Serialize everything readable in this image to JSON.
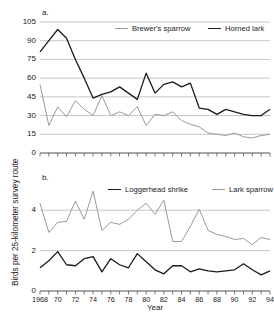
{
  "figure": {
    "xaxis_title": "Year",
    "yaxis_title": "Birds per 25-kilometer  survey route",
    "panel_a_letter": "a.",
    "panel_b_letter": "b."
  },
  "colors": {
    "dark_series": "#1a1a1a",
    "light_series": "#9a9a9a",
    "gridline": "#b9b9b9",
    "axis": "#555555",
    "background": "#ffffff"
  },
  "panel_a": {
    "legend": [
      {
        "label": "Brewer's sparrow",
        "color": "#9a9a9a"
      },
      {
        "label": "Horned lark",
        "color": "#1a1a1a"
      }
    ],
    "yticks": [
      "0",
      "15",
      "30",
      "45",
      "60",
      "75",
      "90",
      "105"
    ]
  },
  "panel_b": {
    "legend": [
      {
        "label": "Loggerhead shrike",
        "color": "#1a1a1a"
      },
      {
        "label": "Lark sparrow",
        "color": "#9a9a9a"
      }
    ],
    "yticks": [
      "0",
      "2",
      "4"
    ]
  },
  "xticks": [
    "1968",
    "70",
    "72",
    "74",
    "76",
    "78",
    "80",
    "82",
    "84",
    "86",
    "88",
    "90",
    "92",
    "94"
  ],
  "chart_data": [
    {
      "type": "line",
      "panel": "a.",
      "title": "",
      "xlabel": "Year",
      "ylabel": "Birds per 25-kilometer survey route",
      "xlim": [
        1968,
        1994
      ],
      "ylim": [
        0,
        105
      ],
      "yticks": [
        0,
        15,
        30,
        45,
        60,
        75,
        90,
        105
      ],
      "xticks": [
        1968,
        1970,
        1972,
        1974,
        1976,
        1978,
        1980,
        1982,
        1984,
        1986,
        1988,
        1990,
        1992,
        1994
      ],
      "grid": true,
      "legend_position": "top-right-inside",
      "x": [
        1968,
        1969,
        1970,
        1971,
        1972,
        1973,
        1974,
        1975,
        1976,
        1977,
        1978,
        1979,
        1980,
        1981,
        1982,
        1983,
        1984,
        1985,
        1986,
        1987,
        1988,
        1989,
        1990,
        1991,
        1992,
        1993,
        1994
      ],
      "series": [
        {
          "name": "Horned lark",
          "color": "#1a1a1a",
          "values": [
            81,
            90,
            99,
            92,
            75,
            60,
            44,
            47,
            49,
            53,
            48,
            43,
            64,
            48,
            55,
            57,
            53,
            56,
            36,
            35,
            31,
            35,
            33,
            31,
            30,
            30,
            35
          ]
        },
        {
          "name": "Brewer's sparrow",
          "color": "#9a9a9a",
          "values": [
            55,
            22,
            37,
            29,
            42,
            35,
            30,
            46,
            30,
            33,
            30,
            37,
            22,
            31,
            30,
            33,
            26,
            23,
            21,
            16,
            15,
            14,
            16,
            13,
            12,
            14,
            15
          ]
        }
      ]
    },
    {
      "type": "line",
      "panel": "b.",
      "title": "",
      "xlabel": "Year",
      "ylabel": "Birds per 25-kilometer survey route",
      "xlim": [
        1968,
        1994
      ],
      "ylim": [
        0,
        5.2
      ],
      "yticks": [
        0,
        2,
        4
      ],
      "xticks": [
        1968,
        1970,
        1972,
        1974,
        1976,
        1978,
        1980,
        1982,
        1984,
        1986,
        1988,
        1990,
        1992,
        1994
      ],
      "grid": true,
      "legend_position": "top-right-inside",
      "x": [
        1968,
        1969,
        1970,
        1971,
        1972,
        1973,
        1974,
        1975,
        1976,
        1977,
        1978,
        1979,
        1980,
        1981,
        1982,
        1983,
        1984,
        1985,
        1986,
        1987,
        1988,
        1989,
        1990,
        1991,
        1992,
        1993,
        1994
      ],
      "series": [
        {
          "name": "Lark sparrow",
          "color": "#9a9a9a",
          "values": [
            4.35,
            2.9,
            3.4,
            3.45,
            4.45,
            3.55,
            4.95,
            3.0,
            3.4,
            3.3,
            3.55,
            4.0,
            4.35,
            3.8,
            4.5,
            2.45,
            2.45,
            3.2,
            4.05,
            3.0,
            2.8,
            2.7,
            2.55,
            2.6,
            2.3,
            2.65,
            2.55
          ]
        },
        {
          "name": "Loggerhead shrike",
          "color": "#1a1a1a",
          "values": [
            1.15,
            1.5,
            1.95,
            1.3,
            1.25,
            1.6,
            1.7,
            0.95,
            1.6,
            1.3,
            1.15,
            1.85,
            1.45,
            1.05,
            0.85,
            1.25,
            1.25,
            0.95,
            1.1,
            1.0,
            0.95,
            1.0,
            1.05,
            1.35,
            1.05,
            0.8,
            1.0
          ]
        }
      ]
    }
  ]
}
